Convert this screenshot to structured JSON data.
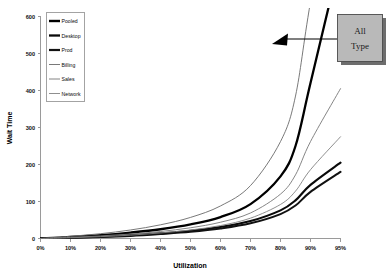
{
  "chart_data": {
    "type": "line",
    "title": "",
    "xlabel": "Utilization",
    "ylabel": "Wait Time",
    "grid": false,
    "legend_position": "top-left",
    "xlim": [
      0,
      95
    ],
    "ylim": [
      0,
      600
    ],
    "x_tick_labels": [
      "0%",
      "10%",
      "20%",
      "30%",
      "40%",
      "50%",
      "60%",
      "70%",
      "80%",
      "90%",
      "95%"
    ],
    "x_tick_values": [
      0,
      10,
      20,
      30,
      40,
      50,
      60,
      70,
      80,
      90,
      95
    ],
    "y_tick_labels": [
      "0",
      "100",
      "200",
      "300",
      "400",
      "500",
      "600"
    ],
    "y_tick_values": [
      0,
      100,
      200,
      300,
      400,
      500,
      600
    ],
    "x": [
      0,
      10,
      20,
      30,
      40,
      50,
      60,
      70,
      80,
      85,
      90,
      95
    ],
    "series": [
      {
        "name": "Pooled",
        "style": "thick-black",
        "color": "#000000",
        "width": 2.3,
        "values": [
          0,
          4,
          9,
          16,
          25,
          38,
          58,
          93,
          168,
          250,
          420,
          760
        ]
      },
      {
        "name": "Desktop",
        "style": "thick-black",
        "color": "#0a0a0a",
        "width": 2.1,
        "values": [
          0,
          2,
          5,
          9,
          14,
          21,
          31,
          47,
          76,
          103,
          145,
          205
        ]
      },
      {
        "name": "Prod",
        "style": "thick-black",
        "color": "#111111",
        "width": 2.0,
        "values": [
          0,
          2,
          4,
          7,
          12,
          18,
          27,
          41,
          66,
          89,
          126,
          180
        ]
      },
      {
        "name": "Billing",
        "style": "thin-gray",
        "color": "#6a6a6a",
        "width": 0.9,
        "values": [
          0,
          6,
          13,
          23,
          37,
          57,
          88,
          143,
          262,
          385,
          640,
          1100
        ]
      },
      {
        "name": "Sales",
        "style": "thin-gray",
        "color": "#777777",
        "width": 0.9,
        "values": [
          0,
          3,
          7,
          12,
          19,
          29,
          44,
          69,
          120,
          172,
          262,
          405
        ]
      },
      {
        "name": "Network",
        "style": "thin-gray",
        "color": "#828282",
        "width": 0.9,
        "values": [
          0,
          2,
          5,
          9,
          15,
          23,
          35,
          55,
          92,
          128,
          186,
          275
        ]
      }
    ],
    "annotations": [
      {
        "text_line1": "All",
        "text_line2": "Type",
        "points_to_series": "Pooled",
        "kind": "callout-box-with-arrow"
      }
    ]
  }
}
